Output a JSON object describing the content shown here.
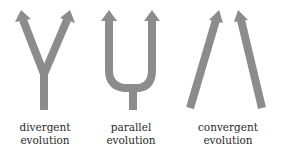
{
  "colors": {
    "arrow": "#8c8c8c",
    "text": "#2a2a2a",
    "background": "#ffffff"
  },
  "panels": [
    {
      "id": "divergent",
      "line1": "divergent",
      "line2": "evolution"
    },
    {
      "id": "parallel",
      "line1": "parallel",
      "line2": "evolution"
    },
    {
      "id": "convergent",
      "line1": "convergent",
      "line2": "evolution"
    }
  ]
}
